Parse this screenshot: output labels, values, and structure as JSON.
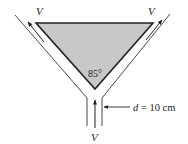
{
  "diagram": {
    "labels": {
      "v_top_left": "V",
      "v_top_right": "V",
      "v_bottom": "V",
      "angle": "85°",
      "d_var": "d",
      "d_value": " = 10 cm"
    },
    "colors": {
      "wedge_fill": "#c8c8c8",
      "line": "#222222"
    }
  }
}
